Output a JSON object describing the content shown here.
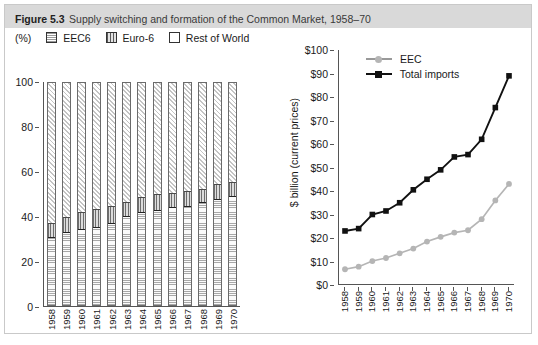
{
  "figure": {
    "number": "Figure 5.3",
    "title": "Supply switching and formation of the Common Market, 1958–70"
  },
  "left_panel": {
    "unit_label": "(%)",
    "legend": [
      {
        "label": "EEC6",
        "swatch": "light-horizontal-hatch"
      },
      {
        "label": "Euro-6",
        "swatch": "dark-vertical-hatch"
      },
      {
        "label": "Rest of World",
        "swatch": "empty-box"
      }
    ]
  },
  "right_panel": {
    "ylabel": "$ billion (current prices)",
    "legend": [
      {
        "label": "EEC",
        "marker": "circle",
        "color": "#b5b5b5"
      },
      {
        "label": "Total imports",
        "marker": "square",
        "color": "#111111"
      }
    ]
  },
  "chart_data": [
    {
      "type": "bar",
      "stacked": true,
      "title": "Supply switching and formation of the Common Market, 1958–70",
      "xlabel": "",
      "ylabel": "(%)",
      "ylim": [
        0,
        100
      ],
      "yticks": [
        0,
        20,
        40,
        60,
        80,
        100
      ],
      "grid": false,
      "legend_position": "top",
      "categories": [
        "1958",
        "1959",
        "1960",
        "1961",
        "1962",
        "1963",
        "1964",
        "1965",
        "1966",
        "1967",
        "1968",
        "1969",
        "1970"
      ],
      "series": [
        {
          "name": "EEC6",
          "values": [
            30.0,
            32.5,
            34.0,
            34.5,
            36.5,
            39.5,
            41.5,
            42.5,
            43.5,
            44.0,
            46.0,
            47.5,
            48.5
          ]
        },
        {
          "name": "Euro-6",
          "values": [
            6.5,
            6.5,
            7.5,
            8.5,
            7.5,
            6.5,
            6.5,
            7.0,
            6.5,
            7.0,
            6.0,
            6.5,
            6.5
          ]
        },
        {
          "name": "Rest of World",
          "values": [
            63.5,
            61.0,
            58.5,
            57.0,
            56.0,
            54.0,
            52.0,
            50.5,
            50.0,
            49.0,
            48.0,
            46.0,
            45.0
          ]
        }
      ]
    },
    {
      "type": "line",
      "title": "",
      "xlabel": "",
      "ylabel": "$ billion (current prices)",
      "ylim": [
        0,
        100
      ],
      "yticks": [
        0,
        10,
        20,
        30,
        40,
        50,
        60,
        70,
        80,
        90,
        100
      ],
      "ytick_labels": [
        "$0",
        "$10",
        "$20",
        "$30",
        "$40",
        "$50",
        "$60",
        "$70",
        "$80",
        "$90",
        "$100"
      ],
      "grid": false,
      "legend_position": "top-left",
      "x": [
        "1958",
        "1959",
        "1960",
        "1961",
        "1962",
        "1963",
        "1964",
        "1965",
        "1966",
        "1967",
        "1968",
        "1969",
        "1970"
      ],
      "series": [
        {
          "name": "EEC",
          "marker": "circle",
          "color": "#b5b5b5",
          "values": [
            6.7,
            7.8,
            10.2,
            11.5,
            13.5,
            15.5,
            18.5,
            20.5,
            22.3,
            23.3,
            28.0,
            36.0,
            43.0
          ]
        },
        {
          "name": "Total imports",
          "marker": "square",
          "color": "#111111",
          "values": [
            23.0,
            24.0,
            30.0,
            31.5,
            35.0,
            40.5,
            45.0,
            49.0,
            54.5,
            55.5,
            62.0,
            75.5,
            89.0
          ]
        }
      ]
    }
  ]
}
